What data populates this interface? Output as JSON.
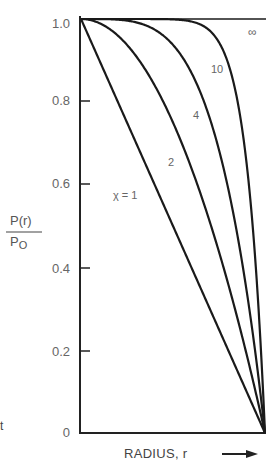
{
  "chart_data": {
    "type": "line",
    "title": "",
    "xlabel": "RADIUS, r",
    "ylabel_numerator": "P(r)",
    "ylabel_denominator": "Po",
    "ylim": [
      0,
      1.0
    ],
    "xlim": [
      0,
      1.0
    ],
    "yticks": [
      "1.0",
      "0.8",
      "0.6",
      "0.4",
      "0.2",
      "0"
    ],
    "grid": false,
    "legend": "inline curve labels",
    "formula_note": "curves follow P(r)/Po = 1 - (r/R)^χ",
    "x": [
      0,
      0.1,
      0.2,
      0.3,
      0.4,
      0.5,
      0.6,
      0.7,
      0.8,
      0.9,
      1.0
    ],
    "series": [
      {
        "name": "χ = 1",
        "label": "χ = 1",
        "values": [
          1.0,
          0.9,
          0.8,
          0.7,
          0.6,
          0.5,
          0.4,
          0.3,
          0.2,
          0.1,
          0.0
        ]
      },
      {
        "name": "2",
        "label": "2",
        "values": [
          1.0,
          0.99,
          0.96,
          0.91,
          0.84,
          0.75,
          0.64,
          0.51,
          0.36,
          0.19,
          0.0
        ]
      },
      {
        "name": "4",
        "label": "4",
        "values": [
          1.0,
          1.0,
          1.0,
          0.99,
          0.97,
          0.94,
          0.87,
          0.76,
          0.59,
          0.34,
          0.0
        ]
      },
      {
        "name": "10",
        "label": "10",
        "values": [
          1.0,
          1.0,
          1.0,
          1.0,
          1.0,
          1.0,
          0.99,
          0.97,
          0.89,
          0.65,
          0.0
        ]
      },
      {
        "name": "∞",
        "label": "∞",
        "values": [
          1.0,
          1.0,
          1.0,
          1.0,
          1.0,
          1.0,
          1.0,
          1.0,
          1.0,
          1.0,
          1.0
        ]
      }
    ]
  },
  "labels": {
    "ytick_10": "1.0",
    "ytick_08": "0.8",
    "ytick_06": "0.6",
    "ytick_04": "0.4",
    "ytick_02": "0.2",
    "ytick_00": "0",
    "curve_1": "χ = 1",
    "curve_2": "2",
    "curve_4": "4",
    "curve_10": "10",
    "curve_inf": "∞",
    "ylabel_num": "P(r)",
    "ylabel_den": "Po",
    "ylabel_den_main": "P",
    "ylabel_den_sub": "O",
    "xlabel": "RADIUS, r",
    "stray_glyph": "t"
  }
}
